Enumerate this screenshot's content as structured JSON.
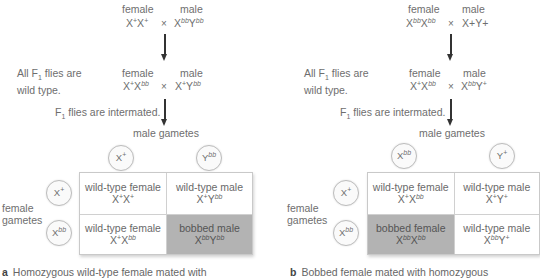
{
  "panel_a": {
    "parents": {
      "female_label": "female",
      "male_label": "male",
      "female_genotype": {
        "base1": "X",
        "sup1": "+",
        "base2": "X",
        "sup2": "+"
      },
      "cross_symbol": "×",
      "male_genotype": {
        "base1": "X",
        "sup1": "bb",
        "base2": "Y",
        "sup2": "bb"
      }
    },
    "f1_note_line1": "All F",
    "f1_note_sub": "1",
    "f1_note_line1_rest": " flies are",
    "f1_note_line2": "wild type.",
    "f1": {
      "female_label": "female",
      "male_label": "male",
      "female_genotype": {
        "base1": "X",
        "sup1": "+",
        "base2": "X",
        "sup2": "bb"
      },
      "cross_symbol": "×",
      "male_genotype": {
        "base1": "X",
        "sup1": "+",
        "base2": "Y",
        "sup2": "bb"
      }
    },
    "intermate_note_pre": "F",
    "intermate_note_sub": "1",
    "intermate_note_rest": " flies are intermated.",
    "male_gametes_label": "male gametes",
    "male_gametes": [
      {
        "base": "X",
        "sup": "+"
      },
      {
        "base": "Y",
        "sup": "bb"
      }
    ],
    "female_gametes_label_line1": "female",
    "female_gametes_label_line2": "gametes",
    "female_gametes": [
      {
        "base": "X",
        "sup": "+"
      },
      {
        "base": "X",
        "sup": "bb"
      }
    ],
    "punnett": [
      {
        "phenotype": "wild-type female",
        "g": {
          "b1": "X",
          "s1": "+",
          "b2": "X",
          "s2": "+"
        },
        "shaded": false
      },
      {
        "phenotype": "wild-type male",
        "g": {
          "b1": "X",
          "s1": "+",
          "b2": "Y",
          "s2": "bb"
        },
        "shaded": false
      },
      {
        "phenotype": "wild-type female",
        "g": {
          "b1": "X",
          "s1": "+",
          "b2": "X",
          "s2": "bb"
        },
        "shaded": false
      },
      {
        "phenotype": "bobbed male",
        "g": {
          "b1": "X",
          "s1": "bb",
          "b2": "Y",
          "s2": "bb"
        },
        "shaded": true
      }
    ],
    "caption_letter": "a",
    "caption_text": "Homozygous wild-type female mated with"
  },
  "panel_b": {
    "parents": {
      "female_label": "female",
      "male_label": "male",
      "female_genotype": {
        "base1": "X",
        "sup1": "bb",
        "base2": "X",
        "sup2": "bb"
      },
      "cross_symbol": "×",
      "male_genotype_text": "X+Y+"
    },
    "f1_note_line1": "All F",
    "f1_note_sub": "1",
    "f1_note_line1_rest": " flies are",
    "f1_note_line2": "wild type.",
    "f1": {
      "female_label": "female",
      "male_label": "male",
      "female_genotype": {
        "base1": "X",
        "sup1": "+",
        "base2": "X",
        "sup2": "bb"
      },
      "cross_symbol": "×",
      "male_genotype": {
        "base1": "X",
        "sup1": "bb",
        "base2": "Y",
        "sup2": "+"
      }
    },
    "intermate_note_pre": "F",
    "intermate_note_sub": "1",
    "intermate_note_rest": " flies are intermated.",
    "male_gametes_label": "male gametes",
    "male_gametes": [
      {
        "base": "X",
        "sup": "bb"
      },
      {
        "base": "Y",
        "sup": "+"
      }
    ],
    "female_gametes_label_line1": "female",
    "female_gametes_label_line2": "gametes",
    "female_gametes": [
      {
        "base": "X",
        "sup": "+"
      },
      {
        "base": "X",
        "sup": "bb"
      }
    ],
    "punnett": [
      {
        "phenotype": "wild-type female",
        "g": {
          "b1": "X",
          "s1": "+",
          "b2": "X",
          "s2": "bb"
        },
        "shaded": false
      },
      {
        "phenotype": "wild-type male",
        "g": {
          "b1": "X",
          "s1": "+",
          "b2": "Y",
          "s2": "+"
        },
        "shaded": false
      },
      {
        "phenotype": "bobbed female",
        "g": {
          "b1": "X",
          "s1": "bb",
          "b2": "X",
          "s2": "bb"
        },
        "shaded": true
      },
      {
        "phenotype": "wild-type male",
        "g": {
          "b1": "X",
          "s1": "bb",
          "b2": "Y",
          "s2": "+"
        },
        "shaded": false
      }
    ],
    "caption_letter": "b",
    "caption_text": "Bobbed female mated with homozygous"
  },
  "colors": {
    "shaded_cell": "#b3b3b3",
    "text": "#6e6e6e",
    "arrow": "#333333"
  }
}
